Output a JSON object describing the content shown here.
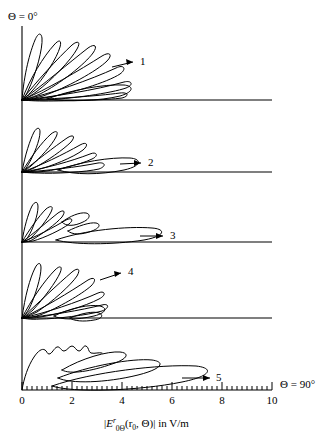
{
  "figure": {
    "top_angle_label": "Θ = 0°",
    "right_angle_label": "Θ = 90°",
    "axis_title_parts": {
      "open_bar": "|",
      "e_symbol": "E",
      "superscript": "r",
      "subscript": "0Θ",
      "args": "(r",
      "args_sub": "0",
      "args_rest": ", Θ)",
      "close_bar": "|",
      "units": " in V/m"
    },
    "axis_title_plain": "|E r0Θ(r0, Θ)| in V/m",
    "x_axis": {
      "min": 0,
      "max": 10,
      "major_ticks": [
        0,
        2,
        4,
        6,
        8,
        10
      ],
      "major_tick_labels": [
        "0",
        "2",
        "4",
        "6",
        "8",
        "10"
      ],
      "minor_tick_step": 0.2
    },
    "panel_labels": [
      "1",
      "2",
      "3",
      "4",
      "5"
    ]
  },
  "chart_data": {
    "type": "line",
    "title": "",
    "subtitle": "",
    "xlabel": "|E^r_{0Θ}(r_0, Θ)| in V/m",
    "ylabel": "",
    "xlim": [
      0,
      10
    ],
    "grid": false,
    "legend": "none",
    "axis_orientation": "polar-half-plane: Θ measured from vertical axis (Θ = 0° up) to horizontal axis (Θ = 90° right)",
    "panels": [
      {
        "label": "1",
        "lobe_count": 8,
        "arrow_tip_value": 4.3,
        "arrow_angle_deg": 60,
        "lobe_peaks": [
          {
            "angle_deg": 11,
            "amplitude": 2.6
          },
          {
            "angle_deg": 22,
            "amplitude": 3.1
          },
          {
            "angle_deg": 33,
            "amplitude": 3.7
          },
          {
            "angle_deg": 44,
            "amplitude": 4.0
          },
          {
            "angle_deg": 55,
            "amplitude": 4.2
          },
          {
            "angle_deg": 66,
            "amplitude": 4.3
          },
          {
            "angle_deg": 78,
            "amplitude": 4.0
          },
          {
            "angle_deg": 88,
            "amplitude": 3.6
          }
        ]
      },
      {
        "label": "2",
        "lobe_count": 7,
        "arrow_tip_value": 4.6,
        "arrow_angle_deg": 84,
        "lobe_peaks": [
          {
            "angle_deg": 13,
            "amplitude": 2.0
          },
          {
            "angle_deg": 25,
            "amplitude": 2.5
          },
          {
            "angle_deg": 37,
            "amplitude": 3.0
          },
          {
            "angle_deg": 50,
            "amplitude": 3.4
          },
          {
            "angle_deg": 63,
            "amplitude": 3.7
          },
          {
            "angle_deg": 76,
            "amplitude": 4.0
          },
          {
            "angle_deg": 88,
            "amplitude": 4.6
          }
        ]
      },
      {
        "label": "3",
        "lobe_count": 6,
        "arrow_tip_value": 5.2,
        "arrow_angle_deg": 87,
        "lobe_peaks": [
          {
            "angle_deg": 14,
            "amplitude": 1.6
          },
          {
            "angle_deg": 28,
            "amplitude": 1.9
          },
          {
            "angle_deg": 42,
            "amplitude": 2.1
          },
          {
            "angle_deg": 57,
            "amplitude": 2.2
          },
          {
            "angle_deg": 72,
            "amplitude": 2.3
          },
          {
            "angle_deg": 88,
            "amplitude": 5.2
          }
        ]
      },
      {
        "label": "4",
        "lobe_count": 7,
        "arrow_tip_value": 4.0,
        "arrow_angle_deg": 56,
        "lobe_peaks": [
          {
            "angle_deg": 12,
            "amplitude": 2.4
          },
          {
            "angle_deg": 24,
            "amplitude": 2.9
          },
          {
            "angle_deg": 36,
            "amplitude": 3.4
          },
          {
            "angle_deg": 49,
            "amplitude": 3.8
          },
          {
            "angle_deg": 62,
            "amplitude": 3.9
          },
          {
            "angle_deg": 75,
            "amplitude": 3.6
          },
          {
            "angle_deg": 88,
            "amplitude": 3.0
          }
        ]
      },
      {
        "label": "5",
        "lobe_count": 4,
        "arrow_tip_value": 7.7,
        "arrow_angle_deg": 89,
        "lobe_peaks": [
          {
            "angle_deg": 35,
            "amplitude": 1.5
          },
          {
            "angle_deg": 66,
            "amplitude": 4.2
          },
          {
            "angle_deg": 80,
            "amplitude": 5.7
          },
          {
            "angle_deg": 89,
            "amplitude": 7.7
          }
        ],
        "note": "broad scalloped main region near the origin plus three elongated near-horizontal lobes"
      }
    ]
  }
}
